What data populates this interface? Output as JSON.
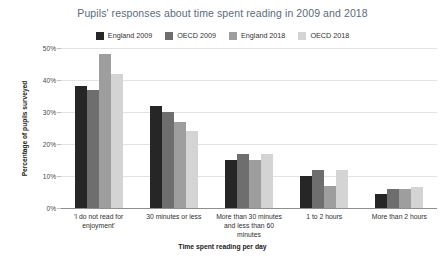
{
  "chart_data": {
    "type": "bar",
    "title": "Pupils' responses about time spent reading in 2009 and 2018",
    "xlabel": "Time spent reading per day",
    "ylabel": "Percentage of pupils surveyed",
    "ylim": [
      0,
      50
    ],
    "grid": true,
    "legend_position": "top-center",
    "y_ticks": [
      "0%",
      "10%",
      "20%",
      "30%",
      "40%",
      "50%"
    ],
    "y_tick_values": [
      0,
      10,
      20,
      30,
      40,
      50
    ],
    "categories": [
      "'I do not read for enjoyment'",
      "30 minutes or less",
      "More than 30 minutes and less than 60 minutes",
      "1 to 2 hours",
      "More than 2 hours"
    ],
    "series": [
      {
        "name": "England 2009",
        "color": "#262626",
        "values": [
          38,
          32,
          15,
          10,
          4.5
        ]
      },
      {
        "name": "OECD 2009",
        "color": "#6e6e6e",
        "values": [
          37,
          30,
          17,
          12,
          6
        ]
      },
      {
        "name": "England 2018",
        "color": "#9e9e9e",
        "values": [
          48,
          27,
          15,
          7,
          6
        ]
      },
      {
        "name": "OECD 2018",
        "color": "#d4d4d4",
        "values": [
          42,
          24,
          17,
          12,
          6.5
        ]
      }
    ]
  },
  "style": {
    "title_color": "#5c6b7a",
    "gridline_color": "#e3e3e3",
    "axis_color": "#8f8f8f",
    "background": "#ffffff"
  }
}
